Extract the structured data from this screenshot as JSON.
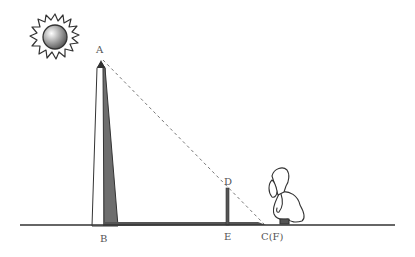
{
  "diagram": {
    "labels": {
      "A": "A",
      "B": "B",
      "D": "D",
      "E": "E",
      "C": "C(F)"
    },
    "elements": {
      "sun": "sun-icon",
      "obelisk": "obelisk",
      "obelisk_shadow": "shaded side",
      "stick": "vertical stick DE",
      "observer": "crouching bearded man",
      "sight_line": "dashed line from A through D to C(F)",
      "ground": "ground line"
    },
    "colors": {
      "line": "#333333",
      "shadow": "#6e6e6e",
      "dash": "#777777",
      "label": "#555555"
    }
  }
}
